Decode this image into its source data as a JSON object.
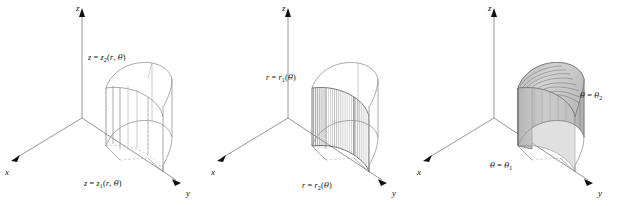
{
  "figure": {
    "background_color": "#ffffff",
    "axis_color": "#8a8a8a",
    "wire_color": "#8d8d8d",
    "shade_light": "#d8d8d8",
    "shade_mid": "#c0c0c0",
    "shade_dark": "#a8a8a8",
    "panel_count": 3
  },
  "axes": {
    "x_label": "x",
    "y_label": "y",
    "z_label": "z"
  },
  "panels": [
    {
      "id": "panel-1",
      "name": "z-bounds-panel",
      "style": "wireframe",
      "axes": {
        "x_label": "x",
        "y_label": "y",
        "z_label": "z"
      },
      "labels": [
        {
          "name": "z-upper-surface-label",
          "text": "z = z2(r, θ)",
          "var": "z",
          "func": "z",
          "subscript": "2",
          "args": "(r, θ)",
          "position": "top"
        },
        {
          "name": "z-lower-surface-label",
          "text": "z = z1(r, θ)",
          "var": "z",
          "func": "z",
          "subscript": "1",
          "args": "(r, θ)",
          "position": "bottom"
        }
      ]
    },
    {
      "id": "panel-2",
      "name": "r-bounds-panel",
      "style": "hatched-inner-wall",
      "axes": {
        "x_label": "x",
        "y_label": "y",
        "z_label": "z"
      },
      "labels": [
        {
          "name": "r-inner-surface-label",
          "text": "r = r1(θ)",
          "var": "r",
          "func": "r",
          "subscript": "1",
          "args": "(θ)",
          "position": "upper-left"
        },
        {
          "name": "r-outer-surface-label",
          "text": "r = r2(θ)",
          "var": "r",
          "func": "r",
          "subscript": "2",
          "args": "(θ)",
          "position": "bottom"
        }
      ]
    },
    {
      "id": "panel-3",
      "name": "theta-bounds-panel",
      "style": "solid-shaded",
      "axes": {
        "x_label": "x",
        "y_label": "y",
        "z_label": "z"
      },
      "labels": [
        {
          "name": "theta-upper-surface-label",
          "text": "θ = θ2",
          "var": "θ",
          "func": "θ",
          "subscript": "2",
          "args": "",
          "position": "right"
        },
        {
          "name": "theta-lower-surface-label",
          "text": "θ = θ1",
          "var": "θ",
          "func": "θ",
          "subscript": "1",
          "args": "",
          "position": "lower-left"
        }
      ]
    }
  ]
}
